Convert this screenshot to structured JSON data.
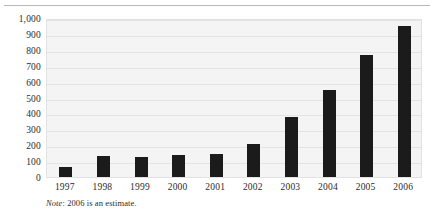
{
  "chart_data": {
    "type": "bar",
    "title": "",
    "subtitle": "",
    "xlabel": "",
    "ylabel": "",
    "categories": [
      "1997",
      "1998",
      "1999",
      "2000",
      "2001",
      "2002",
      "2003",
      "2004",
      "2005",
      "2006"
    ],
    "values": [
      60,
      130,
      125,
      140,
      145,
      205,
      380,
      550,
      770,
      950
    ],
    "ylim": [
      0,
      1000
    ],
    "ytick_values": [
      0,
      100,
      200,
      300,
      400,
      500,
      600,
      700,
      800,
      900,
      1000
    ],
    "ytick_labels": [
      "0",
      "100",
      "200",
      "300",
      "400",
      "500",
      "600",
      "700",
      "800",
      "900",
      "1,000"
    ],
    "grid": true,
    "legend": "none",
    "bar_color": "#1b1b1b",
    "plot_background": "#f4f4f4",
    "gridline_color": "#e4e4e4",
    "annotations": [
      {
        "id": "note",
        "emphasis_text": "Note",
        "text": ": 2006 is an estimate."
      }
    ]
  }
}
